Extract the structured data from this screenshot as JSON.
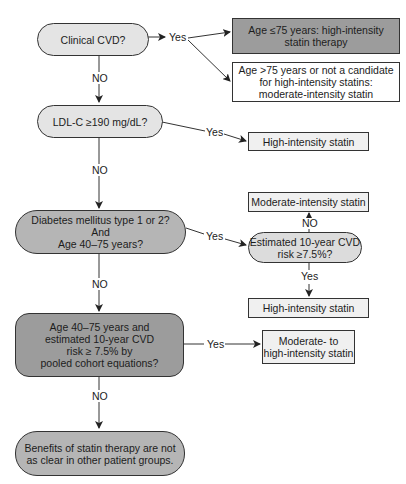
{
  "colors": {
    "line": "#333333",
    "decision_fill_light": "#e4e4e4",
    "decision_fill_dark": "#b5b5b5",
    "outcome_fill_dark": "#9c9c9c",
    "outcome_fill_light": "#f0f0f0",
    "outcome_fill_white": "#ffffff"
  },
  "nodes": {
    "clinical_cvd": "Clinical CVD?",
    "age_le75": "Age ≤75 years: high-intensity\nstatin therapy",
    "age_gt75": "Age >75 years or not a candidate\nfor high-intensity statins:\nmoderate-intensity statin",
    "ldl": "LDL-C ≥190 mg/dL?",
    "high_intensity_1": "High-intensity statin",
    "diabetes": "Diabetes mellitus type 1 or 2?\nAnd\nAge 40–75 years?",
    "moderate_intensity": "Moderate-intensity statin",
    "estimated_risk": "Estimated 10-year CVD\nrisk ≥7.5%?",
    "high_intensity_2": "High-intensity statin",
    "age_40_75": "Age 40–75 years and\nestimated 10-year CVD\nrisk ≥ 7.5% by\npooled cohort equations?",
    "moderate_to_high": "Moderate- to\nhigh-intensity statin",
    "benefits": "Benefits of statin therapy are not\nas clear in other patient groups."
  },
  "edge_labels": {
    "cvd_yes": "Yes",
    "cvd_no": "NO",
    "ldl_yes": "Yes",
    "ldl_no": "NO",
    "diabetes_yes": "Yes",
    "diabetes_no": "NO",
    "risk_no": "NO",
    "risk_yes": "Yes",
    "age_yes": "Yes",
    "age_no": "NO"
  }
}
